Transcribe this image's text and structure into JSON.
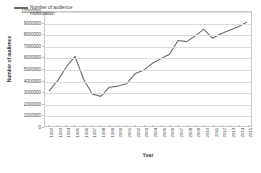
{
  "chart_data": {
    "type": "line",
    "title": "",
    "xlabel": "Year",
    "ylabel": "Number of audience",
    "ylim": [
      0,
      10000000
    ],
    "ytick_step": 1000000,
    "grid": true,
    "legend_position": "top-left",
    "legend": [
      "Number of audience mobilization"
    ],
    "line_color": "#6b6b6b",
    "grid_color": "#dcdcdc",
    "axis_color": "#c9c9c9",
    "categories": [
      "1992",
      "1993",
      "1994",
      "1995",
      "1996",
      "1997",
      "1998",
      "1999",
      "2000",
      "2001",
      "2002",
      "2003",
      "2004",
      "2005",
      "2006",
      "2007",
      "2008",
      "2009",
      "2010",
      "2011",
      "2012",
      "2013",
      "2014",
      "2015"
    ],
    "ytick_labels": [
      "0",
      "1000000",
      "2000000",
      "3000000",
      "4000000",
      "5000000",
      "6000000",
      "7000000",
      "8000000",
      "9000000",
      "10000000"
    ],
    "ytick_values": [
      0,
      1000000,
      2000000,
      3000000,
      4000000,
      5000000,
      6000000,
      7000000,
      8000000,
      9000000,
      10000000
    ],
    "series": [
      {
        "name": "Number of audience mobilization",
        "values": [
          3100000,
          4000000,
          5200000,
          6100000,
          4100000,
          2800000,
          2600000,
          3400000,
          3500000,
          3700000,
          4600000,
          4900000,
          5500000,
          5900000,
          6300000,
          7500000,
          7400000,
          7900000,
          8500000,
          7700000,
          8100000,
          8400000,
          8700000,
          9100000
        ]
      }
    ]
  },
  "legend": {
    "label": "Number of audience mobilization"
  },
  "axes": {
    "x_title": "Year",
    "y_title": "Number of audience"
  }
}
